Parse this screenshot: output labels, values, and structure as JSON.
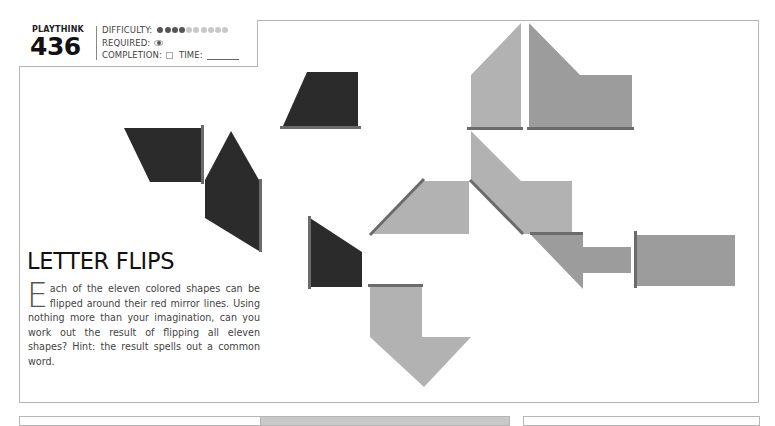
{
  "header": {
    "label": "PLAYTHINK",
    "number": "436",
    "difficulty_label": "DIFFICULTY:",
    "difficulty": {
      "filled": 4,
      "total": 10
    },
    "required_label": "REQUIRED:",
    "required_icon": "eye-icon",
    "completion_label": "COMPLETION:",
    "time_label": "TIME:"
  },
  "puzzle": {
    "title": "LETTER FLIPS",
    "dropcap": "E",
    "body": "ach of the eleven colored shapes can be flipped around their red mirror lines. Using nothing more than your imagination, can you work out the result of flipping all eleven shapes? Hint: the result spells out a common word.",
    "colors": {
      "dark_shape": "#2b2b2b",
      "light_shape": "#b2b2b2",
      "mid_shape": "#9c9c9c",
      "mirror_line": "#6b6b6b"
    },
    "shape_count": 11
  }
}
